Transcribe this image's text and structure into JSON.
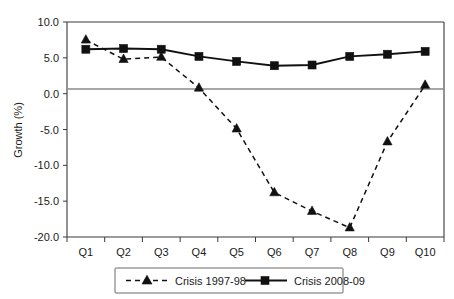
{
  "chart_data": {
    "type": "line",
    "title": "",
    "subtitle": "",
    "xlabel": "",
    "ylabel": "Growth (%)",
    "categories": [
      "Q1",
      "Q2",
      "Q3",
      "Q4",
      "Q5",
      "Q6",
      "Q7",
      "Q8",
      "Q9",
      "Q10"
    ],
    "ylim": [
      -20.0,
      10.0
    ],
    "yticks": [
      10.0,
      5.0,
      0.0,
      -5.0,
      -10.0,
      -15.0,
      -20.0
    ],
    "ytick_labels": [
      "10.0",
      "5.0",
      "0.0",
      "-5.0",
      "-10.0",
      "-15.0",
      "-20.0"
    ],
    "grid": false,
    "zero_line": true,
    "legend_position": "bottom",
    "series": [
      {
        "name": "Crisis 1997-98",
        "marker": "triangle",
        "line_style": "dashed",
        "color": "#111111",
        "values": [
          7.5,
          4.8,
          5.1,
          0.8,
          -4.9,
          -13.8,
          -16.4,
          -18.7,
          -6.7,
          1.2
        ]
      },
      {
        "name": "Crisis 2008-09",
        "marker": "square",
        "line_style": "solid",
        "color": "#111111",
        "values": [
          6.2,
          6.3,
          6.2,
          5.2,
          4.5,
          3.9,
          4.0,
          5.2,
          5.5,
          5.9
        ]
      }
    ]
  },
  "axis": {
    "y_title": "Growth (%)",
    "y_tick_labels": [
      "10.0",
      "5.0",
      "0.0",
      "-5.0",
      "-10.0",
      "-15.0",
      "-20.0"
    ],
    "x_tick_labels": [
      "Q1",
      "Q2",
      "Q3",
      "Q4",
      "Q5",
      "Q6",
      "Q7",
      "Q8",
      "Q9",
      "Q10"
    ]
  },
  "legend": {
    "entries": [
      {
        "label": "Crisis 1997-98"
      },
      {
        "label": "Crisis 2008-09"
      }
    ]
  }
}
